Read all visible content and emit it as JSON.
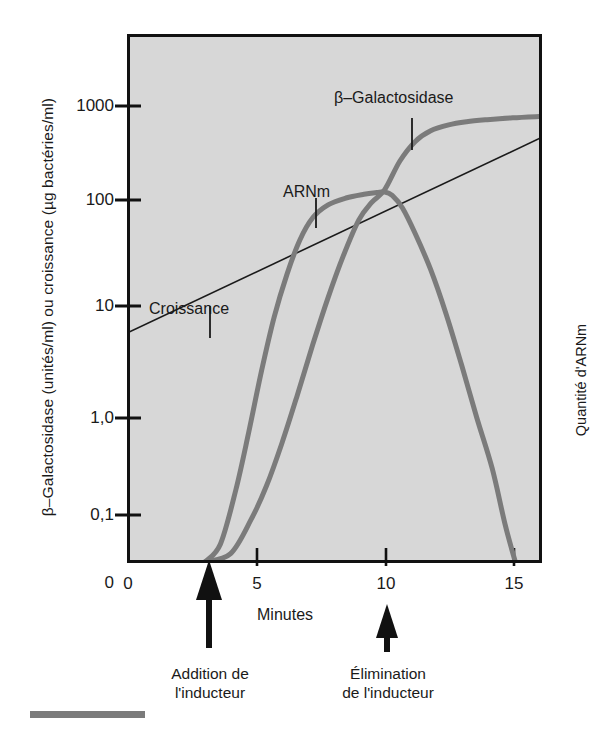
{
  "chart_data": {
    "type": "line",
    "title": "",
    "background": "#d7d7d7",
    "grid": false,
    "legend_position": "inline-annotations",
    "xlabel": "Minutes",
    "ylabel": "β–Galactosidase (unités/ml) ou croissance (µg bactéries/ml)",
    "ylabel_right": "Quantité d'ARNm",
    "xlim": [
      0,
      16.1
    ],
    "xticks": [
      0,
      5,
      10,
      15
    ],
    "xtick_labels": [
      "0",
      "5",
      "10",
      "15"
    ],
    "yscale": "log-with-zero-break",
    "yticks": [
      0.1,
      1.0,
      10,
      100,
      1000
    ],
    "ytick_labels": [
      "0,1",
      "1,0",
      "10",
      "100",
      "1000"
    ],
    "yzero_label": "0",
    "series": [
      {
        "name": "Croissance",
        "color": "#1a1a1a",
        "width": 1.6,
        "x": [
          0,
          16.1
        ],
        "y": [
          5.8,
          460
        ]
      },
      {
        "name": "ARNm",
        "color": "#7b7b7b",
        "width": 5,
        "x": [
          3.0,
          3.6,
          4.2,
          4.7,
          5.2,
          5.7,
          6.2,
          6.7,
          7.2,
          7.8,
          8.5,
          9.2,
          9.7,
          10.0,
          10.3,
          10.7,
          11.2,
          11.8,
          12.4,
          13.0,
          13.6,
          14.2,
          14.7,
          15.1
        ],
        "y": [
          0.02,
          0.05,
          0.18,
          0.7,
          2.6,
          8.0,
          20,
          42,
          68,
          90,
          105,
          115,
          120,
          122,
          112,
          84,
          48,
          22,
          8.5,
          3.0,
          1.0,
          0.3,
          0.08,
          0.02
        ]
      },
      {
        "name": "β–Galactosidase",
        "color": "#7b7b7b",
        "width": 5,
        "x": [
          3.0,
          4.0,
          4.8,
          5.4,
          6.0,
          6.6,
          7.2,
          7.8,
          8.4,
          9.0,
          9.5,
          10.0,
          10.6,
          11.2,
          11.8,
          12.5,
          13.2,
          14.0,
          15.0,
          16.1
        ],
        "y": [
          0.02,
          0.04,
          0.09,
          0.2,
          0.55,
          1.6,
          4.5,
          12,
          30,
          65,
          95,
          128,
          260,
          420,
          545,
          630,
          680,
          715,
          750,
          775
        ]
      }
    ],
    "annotations": [
      {
        "name": "croissance-label",
        "text": "Croissance",
        "x": 2.1,
        "y": 30
      },
      {
        "name": "arnm-label",
        "text": "ARNm",
        "x": 6.3,
        "y": 175
      },
      {
        "name": "beta-gal-label",
        "text": "β–Galactosidase",
        "x": 11.0,
        "y": 1700
      },
      {
        "name": "addition-marker",
        "text": "Addition de\nl'inducteur",
        "x": 3.0
      },
      {
        "name": "elimination-marker",
        "text": "Élimination\nde l'inducteur",
        "x": 10.0
      }
    ]
  },
  "axes": {
    "x_title": "Minutes",
    "y_title_left": "β–Galactosidase (unités/ml) ou croissance (µg bactéries/ml)",
    "y_title_right": "Quantité d'ARNm",
    "y_ticks": [
      "1000",
      "100",
      "10",
      "1,0",
      "0,1",
      "0"
    ],
    "x_ticks": [
      "0",
      "5",
      "10",
      "15"
    ]
  },
  "curve_labels": {
    "growth": "Croissance",
    "mrna": "ARNm",
    "enzyme": "β–Galactosidase"
  },
  "markers": {
    "addition_line1": "Addition de",
    "addition_line2": "l'inducteur",
    "elimination_line1": "Élimination",
    "elimination_line2": "de l'inducteur"
  },
  "colors": {
    "plot_background": "#d7d7d7",
    "frame": "#111111",
    "curve": "#7b7b7b",
    "growth_line": "#1a1a1a",
    "scalebar": "#7b7b7b"
  }
}
